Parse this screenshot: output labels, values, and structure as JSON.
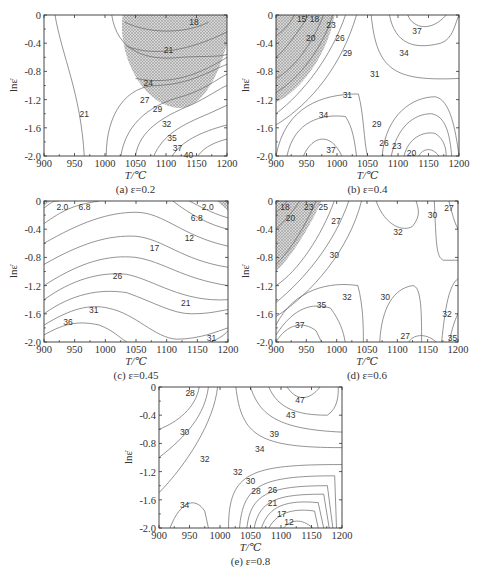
{
  "figure": {
    "panels": [
      {
        "id": "a",
        "caption": "(a) ε=0.2",
        "frame": {
          "x": 44,
          "y": 15,
          "w": 183,
          "h": 141
        },
        "hatch_path": "M0.43,0 C0.4,0.3 0.55,0.66 0.75,0.66 C0.88,0.64 0.96,0.4 1,0.2 L1,0 Z",
        "contours": [
          {
            "d": "M0.06,0 C0.1,0.3 0.2,0.55 0.22,1",
            "label": "21",
            "lx": 0.22,
            "ly": 0.7
          },
          {
            "d": "M0.37,0 C0.4,0.25 0.55,0.33 0.75,0.3 C0.85,0.29 0.95,0.3 1,0.28",
            "label": "",
            "lx": 0,
            "ly": 0
          },
          {
            "d": "M0.44,0.05 C0.6,0.15 0.8,0.12 0.9,0.05",
            "label": "18",
            "lx": 0.82,
            "ly": 0.05
          },
          {
            "d": "M0.45,0.22 C0.6,0.3 0.8,0.25 1,0.12",
            "label": "21",
            "lx": 0.68,
            "ly": 0.25
          },
          {
            "d": "M0.5,0.45 C0.7,0.5 0.85,0.42 1,0.3",
            "label": "24",
            "lx": 0.57,
            "ly": 0.48
          },
          {
            "d": "M0.34,1 C0.34,0.7 0.45,0.5 0.62,0.5 C0.8,0.49 0.9,0.4 1,0.35",
            "label": "27",
            "lx": 0.55,
            "ly": 0.6
          },
          {
            "d": "M0.42,1 C0.45,0.75 0.6,0.63 0.75,0.58 C0.88,0.53 0.95,0.45 1,0.42",
            "label": "29",
            "lx": 0.62,
            "ly": 0.67
          },
          {
            "d": "M0.5,1 C0.52,0.82 0.65,0.72 0.8,0.64 C0.9,0.58 0.96,0.52 1,0.5",
            "label": "32",
            "lx": 0.67,
            "ly": 0.77
          },
          {
            "d": "M0.6,1 C0.65,0.85 0.75,0.78 0.9,0.7 L1,0.64",
            "label": "35",
            "lx": 0.7,
            "ly": 0.87
          },
          {
            "d": "M0.7,1 C0.75,0.9 0.85,0.83 1,0.78",
            "label": "37",
            "lx": 0.73,
            "ly": 0.94
          },
          {
            "d": "M0.84,1 C0.88,0.93 0.94,0.9 1,0.88",
            "label": "40",
            "lx": 0.79,
            "ly": 0.99
          }
        ]
      },
      {
        "id": "b",
        "caption": "(b) ε=0.4",
        "frame": {
          "x": 276,
          "y": 15,
          "w": 183,
          "h": 141
        },
        "hatch_path": "M0,0 L0.32,0 C0.28,0.3 0.12,0.55 0,0.62 Z",
        "contours": [
          {
            "d": "M0.1,0 C0.07,0.08 0.03,0.12 0,0.15",
            "label": "15",
            "lx": 0.14,
            "ly": 0.03
          },
          {
            "d": "M0.18,0 C0.12,0.12 0.05,0.25 0,0.3",
            "label": "18",
            "lx": 0.21,
            "ly": 0.03
          },
          {
            "d": "M0.26,0 C0.2,0.2 0.1,0.38 0,0.45",
            "label": "20",
            "lx": 0.19,
            "ly": 0.16
          },
          {
            "d": "M0.31,0 C0.26,0.22 0.13,0.45 0,0.55",
            "label": "23",
            "lx": 0.3,
            "ly": 0.07
          },
          {
            "d": "M0.38,0 C0.3,0.3 0.15,0.55 0,0.7",
            "label": "26",
            "lx": 0.35,
            "ly": 0.16
          },
          {
            "d": "M0.44,0 C0.36,0.35 0.2,0.62 0,0.78",
            "label": "29",
            "lx": 0.39,
            "ly": 0.27
          },
          {
            "d": "M0.52,0 C0.55,0.4 0.65,0.47 1,0.45",
            "label": "31",
            "lx": 0.54,
            "ly": 0.42
          },
          {
            "d": "M0.62,0 C0.65,0.2 0.75,0.25 0.9,0.2 C0.97,0.17 0.98,0.05 1,0",
            "label": "34",
            "lx": 0.7,
            "ly": 0.27
          },
          {
            "d": "M0.72,0 C0.75,0.1 0.85,0.12 0.93,0",
            "label": "37",
            "lx": 0.77,
            "ly": 0.11
          },
          {
            "d": "M0,1 C0.05,0.65 0.25,0.56 0.45,0.56 C0.48,0.7 0.48,0.9 0.5,1",
            "label": "31",
            "lx": 0.39,
            "ly": 0.57
          },
          {
            "d": "M0.06,1 C0.1,0.75 0.25,0.7 0.38,0.72 C0.42,0.8 0.43,0.9 0.44,1",
            "label": "34",
            "lx": 0.26,
            "ly": 0.71
          },
          {
            "d": "M0.15,1 C0.2,0.85 0.3,0.83 0.36,1",
            "label": "37",
            "lx": 0.3,
            "ly": 0.96
          },
          {
            "d": "M0.58,1 C0.6,0.7 0.75,0.58 0.87,0.58 C0.95,0.6 0.98,0.8 1,1",
            "label": "29",
            "lx": 0.55,
            "ly": 0.77
          },
          {
            "d": "M0.63,1 C0.66,0.8 0.75,0.7 0.85,0.7 C0.93,0.72 0.95,0.85 0.96,1",
            "label": "26",
            "lx": 0.59,
            "ly": 0.91
          },
          {
            "d": "M0.7,1 C0.72,0.88 0.8,0.82 0.87,0.84 C0.92,0.88 0.93,0.95 0.93,1",
            "label": "23",
            "lx": 0.66,
            "ly": 0.93
          },
          {
            "d": "M0.78,1 C0.8,0.95 0.85,0.93 0.89,1",
            "label": "20",
            "lx": 0.74,
            "ly": 0.98
          }
        ]
      },
      {
        "id": "c",
        "caption": "(c) ε=0.45",
        "frame": {
          "x": 44,
          "y": 201,
          "w": 184,
          "h": 141
        },
        "hatch_path": "M0,0 L0.04,0 L0,0.03 Z M0.94,0 L1,0 L1,0.07 Z",
        "contours": [
          {
            "d": "M0,0.05 C0.05,0 0.05,0 0.08,0",
            "label": "2.0",
            "lx": 0.1,
            "ly": 0.04
          },
          {
            "d": "M0.79,0 C0.85,0.04 0.9,0.08 1,0.12",
            "label": "2.0",
            "lx": 0.89,
            "ly": 0.04
          },
          {
            "d": "M0,0.16 C0.1,0.07 0.15,0.03 0.3,0",
            "label": "6.8",
            "lx": 0.22,
            "ly": 0.04
          },
          {
            "d": "M0.7,0 C0.8,0.1 0.9,0.17 1,0.2",
            "label": "6.8",
            "lx": 0.83,
            "ly": 0.12
          },
          {
            "d": "M0,0.3 C0.2,0.15 0.35,0.08 0.5,0.08 C0.65,0.08 0.75,0.25 1,0.32",
            "label": "12",
            "lx": 0.79,
            "ly": 0.26
          },
          {
            "d": "M0,0.45 C0.2,0.3 0.35,0.24 0.5,0.25 C0.65,0.27 0.75,0.42 1,0.47",
            "label": "17",
            "lx": 0.6,
            "ly": 0.33
          },
          {
            "d": "M0,0.6 C0.2,0.43 0.35,0.38 0.5,0.4 C0.65,0.43 0.75,0.55 1,0.6",
            "label": "",
            "lx": 0,
            "ly": 0
          },
          {
            "d": "M0,0.7 C0.15,0.56 0.3,0.5 0.45,0.52 C0.6,0.56 0.75,0.72 1,0.7",
            "label": "26",
            "lx": 0.4,
            "ly": 0.53
          },
          {
            "d": "M0,0.8 C0.15,0.66 0.3,0.62 0.45,0.65 C0.6,0.72 0.7,0.8 0.8,0.8 C0.9,0.8 0.95,0.78 1,0.77",
            "label": "21",
            "lx": 0.77,
            "ly": 0.72
          },
          {
            "d": "M0,0.88 C0.15,0.76 0.25,0.73 0.35,0.76 C0.5,0.8 0.6,0.97 0.72,0.98 C0.85,0.98 0.95,0.92 1,0.9",
            "label": "31",
            "lx": 0.27,
            "ly": 0.77
          },
          {
            "d": "M0,0.95 C0.12,0.86 0.2,0.85 0.3,0.88 C0.38,0.92 0.4,0.96 0.45,1",
            "label": "36",
            "lx": 0.13,
            "ly": 0.86
          },
          {
            "d": "M0.9,1 C0.95,0.98 0.98,0.95 1,0.92",
            "label": "31",
            "lx": 0.91,
            "ly": 0.97
          }
        ]
      },
      {
        "id": "d",
        "caption": "(d) ε=0.6",
        "frame": {
          "x": 276,
          "y": 201,
          "w": 182,
          "h": 141
        },
        "hatch_path": "M0,0 L0.25,0 C0.18,0.2 0.08,0.4 0,0.5 Z",
        "contours": [
          {
            "d": "M0.06,0 C0.04,0.04 0.02,0.06 0,0.08",
            "label": "18",
            "lx": 0.05,
            "ly": 0.04
          },
          {
            "d": "M0.13,0 C0.08,0.1 0.04,0.15 0,0.2",
            "label": "20",
            "lx": 0.08,
            "ly": 0.12
          },
          {
            "d": "M0.22,0 C0.16,0.18 0.08,0.35 0,0.45",
            "label": "23",
            "lx": 0.18,
            "ly": 0.04
          },
          {
            "d": "M0.32,0 C0.25,0.25 0.12,0.5 0,0.6",
            "label": "25",
            "lx": 0.26,
            "ly": 0.04
          },
          {
            "d": "M0.4,0 C0.32,0.3 0.16,0.55 0,0.72",
            "label": "27",
            "lx": 0.33,
            "ly": 0.14
          },
          {
            "d": "M0.47,0 C0.4,0.35 0.2,0.65 0,0.82",
            "label": "30",
            "lx": 0.32,
            "ly": 0.38
          },
          {
            "d": "M0.55,0 C0.6,0.18 0.7,0.22 0.75,0.18 C0.8,0.1 0.78,0.05 0.77,0",
            "label": "32",
            "lx": 0.67,
            "ly": 0.22
          },
          {
            "d": "M0.87,0 C0.88,0.3 0.88,0.4 0.92,0.42 L1,0.42",
            "label": "30",
            "lx": 0.86,
            "ly": 0.1
          },
          {
            "d": "M0.95,0 C0.97,0.1 0.98,0.15 1,0.2",
            "label": "27",
            "lx": 0.95,
            "ly": 0.05
          },
          {
            "d": "M0,0.88 C0.1,0.62 0.3,0.57 0.45,0.6 C0.48,0.75 0.48,0.9 0.48,1",
            "label": "32",
            "lx": 0.39,
            "ly": 0.68
          },
          {
            "d": "M0,0.95 C0.1,0.75 0.2,0.72 0.3,0.76 C0.35,0.85 0.37,0.92 0.38,1",
            "label": "35",
            "lx": 0.25,
            "ly": 0.74
          },
          {
            "d": "M0,1 C0.06,0.87 0.15,0.85 0.22,0.92 L0.25,1",
            "label": "37",
            "lx": 0.13,
            "ly": 0.88
          },
          {
            "d": "M0.57,1 C0.58,0.75 0.65,0.62 0.75,0.6 C0.8,0.6 0.8,0.8 0.8,1",
            "label": "30",
            "lx": 0.6,
            "ly": 0.68
          },
          {
            "d": "M0.73,1 C0.75,0.95 0.82,0.93 0.88,1",
            "label": "27",
            "lx": 0.71,
            "ly": 0.96
          },
          {
            "d": "M0.91,1 C0.93,0.75 0.95,0.6 1,0.55",
            "label": "32",
            "lx": 0.94,
            "ly": 0.8
          },
          {
            "d": "M0.95,1 C0.97,0.9 0.98,0.85 1,0.8",
            "label": "35",
            "lx": 0.97,
            "ly": 0.97
          }
        ]
      },
      {
        "id": "e",
        "caption": "(e) ε=0.8",
        "frame": {
          "x": 159,
          "y": 387,
          "w": 183,
          "h": 141
        },
        "hatch_path": "",
        "contours": [
          {
            "d": "M0,0.3 C0.1,0.25 0.2,0.15 0.22,0",
            "label": "28",
            "lx": 0.17,
            "ly": 0.04
          },
          {
            "d": "M0,0.5 C0.15,0.35 0.25,0.2 0.27,0",
            "label": "30",
            "lx": 0.14,
            "ly": 0.32
          },
          {
            "d": "M0,0.75 C0.15,0.55 0.3,0.25 0.32,0",
            "label": "32",
            "lx": 0.25,
            "ly": 0.51
          },
          {
            "d": "M0.42,0 C0.45,0.35 0.55,0.43 1,0.43",
            "label": "34",
            "lx": 0.55,
            "ly": 0.44
          },
          {
            "d": "M0.5,0 C0.55,0.2 0.65,0.3 1,0.32",
            "label": "39",
            "lx": 0.63,
            "ly": 0.33
          },
          {
            "d": "M0.6,0 C0.65,0.15 0.75,0.2 0.92,0.2 C0.98,0.15 0.98,0.05 0.98,0",
            "label": "43",
            "lx": 0.72,
            "ly": 0.2
          },
          {
            "d": "M0.7,0 C0.75,0.1 0.82,0.1 0.88,0",
            "label": "47",
            "lx": 0.77,
            "ly": 0.09
          },
          {
            "d": "M0.06,1 C0.12,0.8 0.2,0.78 0.25,0.88 L0.27,1",
            "label": "34",
            "lx": 0.14,
            "ly": 0.84
          },
          {
            "d": "M0.38,1 C0.38,0.6 0.5,0.55 1,0.55",
            "label": "32",
            "lx": 0.43,
            "ly": 0.6
          },
          {
            "d": "M0.44,1 C0.46,0.7 0.55,0.63 0.96,0.63 L0.97,1",
            "label": "30",
            "lx": 0.5,
            "ly": 0.67
          },
          {
            "d": "M0.48,1 C0.5,0.76 0.6,0.7 0.92,0.7 L0.95,1",
            "label": "28",
            "lx": 0.53,
            "ly": 0.74
          },
          {
            "d": "M0.52,1 C0.55,0.8 0.65,0.76 0.9,0.76 L0.93,1",
            "label": "26",
            "lx": 0.62,
            "ly": 0.73
          },
          {
            "d": "M0.56,1 C0.6,0.84 0.7,0.8 0.87,0.82 L0.9,1",
            "label": "21",
            "lx": 0.62,
            "ly": 0.82
          },
          {
            "d": "M0.6,1 C0.65,0.88 0.75,0.86 0.85,0.88 L0.87,1",
            "label": "17",
            "lx": 0.67,
            "ly": 0.9
          },
          {
            "d": "M0.68,1 C0.72,0.94 0.78,0.93 0.84,1",
            "label": "12",
            "lx": 0.71,
            "ly": 0.96
          }
        ]
      }
    ],
    "x_ticks": [
      "900",
      "950",
      "1000",
      "1050",
      "1100",
      "1150",
      "1200"
    ],
    "y_ticks": [
      "0",
      "-0.4",
      "-0.8",
      "-1.2",
      "-1.6",
      "-2.0"
    ],
    "x_axis_label": "T/℃",
    "y_axis_label": "lnε̇"
  },
  "chart_data": [
    {
      "type": "heatmap",
      "title": "(a) ε=0.2",
      "xlabel": "T/℃",
      "ylabel": "lnε̇",
      "xlim": [
        900,
        1200
      ],
      "ylim": [
        -2.0,
        0
      ],
      "x_ticks": [
        900,
        950,
        1000,
        1050,
        1100,
        1150,
        1200
      ],
      "y_ticks": [
        0,
        -0.4,
        -0.8,
        -1.2,
        -1.6,
        -2.0
      ],
      "contour_levels": [
        18,
        21,
        24,
        27,
        29,
        32,
        35,
        37,
        40
      ],
      "instability_region": "hatched, approx T 1040-1200, lnε̇ -0.85-0"
    },
    {
      "type": "heatmap",
      "title": "(b) ε=0.4",
      "xlabel": "T/℃",
      "ylabel": "lnε̇",
      "xlim": [
        900,
        1200
      ],
      "ylim": [
        -2.0,
        0
      ],
      "contour_levels": [
        15,
        18,
        20,
        23,
        26,
        29,
        31,
        34,
        37
      ],
      "instability_region": "hatched, approx T 900-1000, lnε̇ -1.25-0"
    },
    {
      "type": "heatmap",
      "title": "(c) ε=0.45",
      "xlabel": "T/℃",
      "ylabel": "lnε̇",
      "xlim": [
        900,
        1200
      ],
      "ylim": [
        -2.0,
        0
      ],
      "contour_levels": [
        2.0,
        6.8,
        12,
        17,
        21,
        26,
        31,
        36
      ],
      "instability_region": "small hatched corners at T 900 and T 1200, lnε̇ ~0"
    },
    {
      "type": "heatmap",
      "title": "(d) ε=0.6",
      "xlabel": "T/℃",
      "ylabel": "lnε̇",
      "xlim": [
        900,
        1200
      ],
      "ylim": [
        -2.0,
        0
      ],
      "contour_levels": [
        18,
        20,
        23,
        25,
        27,
        30,
        32,
        35,
        37
      ],
      "instability_region": "hatched, approx T 900-975, lnε̇ -1.0-0"
    },
    {
      "type": "heatmap",
      "title": "(e) ε=0.8",
      "xlabel": "T/℃",
      "ylabel": "lnε̇",
      "xlim": [
        900,
        1200
      ],
      "ylim": [
        -2.0,
        0
      ],
      "contour_levels": [
        12,
        17,
        21,
        26,
        28,
        30,
        32,
        34,
        39,
        43,
        47
      ],
      "instability_region": "none"
    }
  ]
}
